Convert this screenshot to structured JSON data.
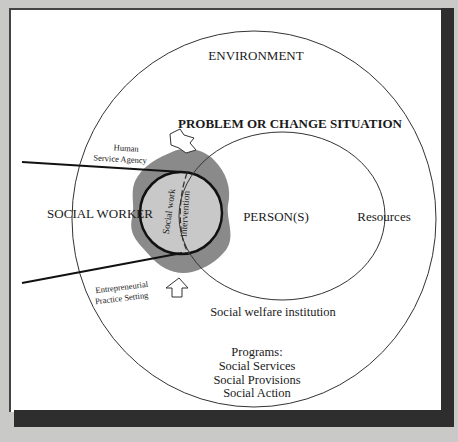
{
  "diagram": {
    "labels": {
      "environment": "ENVIRONMENT",
      "problem": "PROBLEM OR CHANGE SITUATION",
      "social_worker": "SOCIAL WORKER",
      "persons": "PERSON(S)",
      "resources": "Resources",
      "human_service_agency_1": "Human",
      "human_service_agency_2": "Service Agency",
      "entrepreneurial_1": "Entrepreneurial",
      "entrepreneurial_2": "Practice Setting",
      "intervention_1": "Social work",
      "intervention_2": "intervention",
      "institution": "Social welfare institution",
      "programs_title": "Programs:",
      "programs": [
        "Social Services",
        "Social Provisions",
        "Social Action"
      ]
    },
    "colors": {
      "background": "#c9c9c7",
      "panel": "#ffffff",
      "blob": "#8a8a8a",
      "intervention_fill": "#c8c8c8",
      "stroke": "#1a1a1a"
    }
  }
}
